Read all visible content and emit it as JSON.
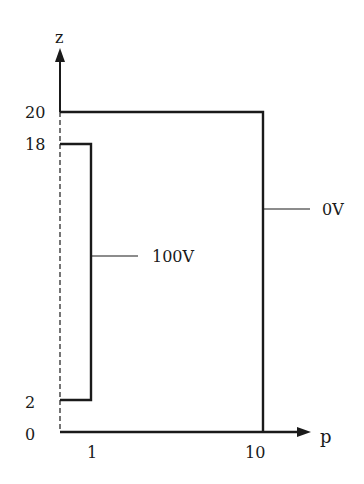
{
  "diagram": {
    "axes": {
      "vertical_label": "z",
      "horizontal_label": "p",
      "z_ticks": [
        "20",
        "18",
        "2",
        "0"
      ],
      "p_ticks": [
        "1",
        "10"
      ]
    },
    "labels": {
      "inner_electrode": "100V",
      "outer_electrode": "0V"
    },
    "colors": {
      "line": "#1a1a1a",
      "background": "#ffffff"
    }
  }
}
